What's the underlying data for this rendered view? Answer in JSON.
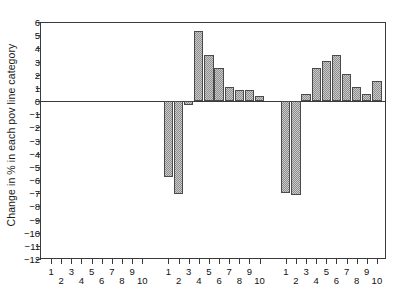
{
  "chart_data": {
    "type": "bar",
    "title": "",
    "xlabel": "",
    "ylabel": "Change in % in each pov line category",
    "ylim": [
      -12,
      6
    ],
    "ytick_labels": [
      "6",
      "5",
      "4",
      "3",
      "2",
      "1",
      "0",
      "−1",
      "−2",
      "−3",
      "−4",
      "−5",
      "−6",
      "−7",
      "−8",
      "−9",
      "−10",
      "−11",
      "−12"
    ],
    "ytick_values": [
      6,
      5,
      4,
      3,
      2,
      1,
      0,
      -1,
      -2,
      -3,
      -4,
      -5,
      -6,
      -7,
      -8,
      -9,
      -10,
      -11,
      -12
    ],
    "grid": false,
    "legend": null,
    "categories": [
      "1",
      "2",
      "3",
      "4",
      "5",
      "6",
      "7",
      "8",
      "9",
      "10"
    ],
    "groups": [
      {
        "name": "group-1",
        "categories": [
          "1",
          "2",
          "3",
          "4",
          "5",
          "6",
          "7",
          "8",
          "9",
          "10"
        ],
        "values": [
          0,
          0,
          0,
          0,
          0,
          0,
          0,
          0,
          0,
          0
        ]
      },
      {
        "name": "group-2",
        "categories": [
          "1",
          "2",
          "3",
          "4",
          "5",
          "6",
          "7",
          "8",
          "9",
          "10"
        ],
        "values": [
          -5.8,
          -7.1,
          -0.3,
          5.3,
          3.5,
          2.5,
          1.05,
          0.8,
          0.8,
          0.4
        ]
      },
      {
        "name": "group-3",
        "categories": [
          "1",
          "2",
          "3",
          "4",
          "5",
          "6",
          "7",
          "8",
          "9",
          "10"
        ],
        "values": [
          -6.95,
          -7.15,
          0.55,
          2.5,
          3.05,
          3.5,
          2.05,
          1.05,
          0.55,
          1.5
        ]
      }
    ],
    "colors": {
      "bar_fill": "#a8a8a8",
      "bar_edge": "#4a4a4a",
      "axis": "#3a3a3a",
      "text": "#111111",
      "background": "#ffffff"
    }
  }
}
